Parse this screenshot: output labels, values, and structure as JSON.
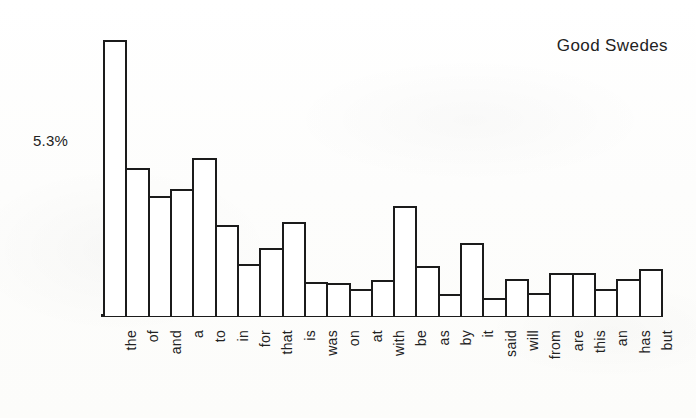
{
  "chart_data": {
    "type": "bar",
    "title": "Good Swedes",
    "xlabel": "",
    "ylabel": "",
    "grid": false,
    "legend": "none",
    "axis_value_label": "5.3%",
    "axis_value_label_percent": 5.3,
    "ylim": [
      0,
      8.1
    ],
    "units": "%",
    "categories": [
      "the",
      "of",
      "and",
      "a",
      "to",
      "in",
      "for",
      "that",
      "is",
      "was",
      "on",
      "at",
      "with",
      "be",
      "as",
      "by",
      "it",
      "said",
      "will",
      "from",
      "are",
      "this",
      "an",
      "has",
      "but"
    ],
    "values": [
      8.1,
      4.33,
      3.51,
      3.72,
      4.63,
      2.66,
      1.54,
      2.0,
      2.75,
      1.0,
      0.97,
      0.79,
      1.06,
      3.24,
      1.48,
      0.64,
      2.15,
      0.54,
      1.09,
      0.67,
      1.27,
      1.27,
      0.79,
      1.09,
      1.39
    ]
  },
  "style": {
    "bar_fill": "#ffffff",
    "bar_stroke": "#1b1b1b",
    "axis_color": "#1b1b1b",
    "text_color": "#222222",
    "background": "#ffffff"
  }
}
